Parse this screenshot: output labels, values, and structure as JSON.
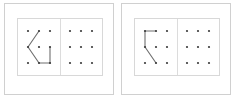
{
  "canvas": {
    "width": 236,
    "height": 101,
    "background": "#ffffff",
    "description": "Two side-by-side panels each showing a dot-grid puzzle: a drawn polyline figure on the left half and an empty 3x3 dot grid on the right half."
  },
  "style": {
    "panel_border_color": "#d0d0d0",
    "inner_border_color": "#d8d8d8",
    "divider_color": "#dcdcdc",
    "dot_color": "#3a3a3a",
    "line_color": "#6e6e6e",
    "dot_radius": 1.1,
    "line_width": 1.1
  },
  "grid": {
    "rows": 3,
    "cols": 3,
    "points": [
      {
        "id": "r0c0",
        "x": 10,
        "y": 12
      },
      {
        "id": "r0c1",
        "x": 21,
        "y": 12
      },
      {
        "id": "r0c2",
        "x": 32,
        "y": 12
      },
      {
        "id": "r1c0",
        "x": 10,
        "y": 28
      },
      {
        "id": "r1c1",
        "x": 21,
        "y": 28
      },
      {
        "id": "r1c2",
        "x": 32,
        "y": 28
      },
      {
        "id": "r2c0",
        "x": 10,
        "y": 44
      },
      {
        "id": "r2c1",
        "x": 21,
        "y": 44
      },
      {
        "id": "r2c2",
        "x": 32,
        "y": 44
      }
    ]
  },
  "panels": [
    {
      "name": "panel-left",
      "figure": {
        "name": "arrow-like-figure",
        "polylines": [
          [
            "r0c1",
            "r1c0",
            "r2c1",
            "r2c2"
          ],
          [
            "r1c2",
            "r2c2"
          ]
        ]
      },
      "answer_grid": {
        "name": "empty-dot-grid",
        "polylines": []
      }
    },
    {
      "name": "panel-right",
      "figure": {
        "name": "flag-like-figure",
        "polylines": [
          [
            "r0c1",
            "r0c0",
            "r1c0",
            "r2c1"
          ]
        ]
      },
      "answer_grid": {
        "name": "empty-dot-grid",
        "polylines": []
      }
    }
  ]
}
